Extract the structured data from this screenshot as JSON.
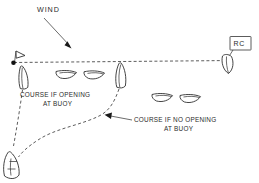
{
  "diagram": {
    "title_label": "WIND",
    "background_color": "#ffffff",
    "ink_color": "#303030",
    "labels": {
      "wind": "WIND",
      "course_opening_line1": "COURSE IF OPENING",
      "course_opening_line2": "AT BUOY",
      "course_no_opening_line1": "COURSE IF NO OPENING",
      "course_no_opening_line2": "AT BUOY",
      "race_committee": "RC"
    },
    "marks": {
      "buoy_name": "pin-end-buoy",
      "committee_boat_name": "race-committee-boat",
      "start_line_name": "start-line"
    },
    "boats": [
      {
        "name": "boat-at-pin",
        "x": 24,
        "y": 78
      },
      {
        "name": "boat-fleet-1",
        "x": 69,
        "y": 75
      },
      {
        "name": "boat-fleet-2",
        "x": 95,
        "y": 76
      },
      {
        "name": "boat-at-line-mid",
        "x": 120,
        "y": 78
      },
      {
        "name": "boat-fleet-3",
        "x": 165,
        "y": 98
      },
      {
        "name": "boat-fleet-4",
        "x": 192,
        "y": 100
      },
      {
        "name": "boat-approach-lower-left",
        "x": 14,
        "y": 163
      }
    ]
  }
}
